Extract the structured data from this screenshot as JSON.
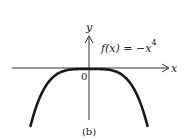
{
  "chart_data": {
    "type": "line",
    "title": "",
    "function_label": "f(x) = −x",
    "function_exponent": "4",
    "xlabel": "x",
    "ylabel": "y",
    "origin_label": "0",
    "caption": "(b)",
    "series": [
      {
        "name": "f(x) = -x^4",
        "x": [
          -1.4,
          -1.2,
          -1.0,
          -0.8,
          -0.6,
          -0.4,
          -0.2,
          0,
          0.2,
          0.4,
          0.6,
          0.8,
          1.0,
          1.2,
          1.4
        ],
        "y": [
          -3.84,
          -2.07,
          -1.0,
          -0.41,
          -0.13,
          -0.03,
          0.0,
          0,
          0.0,
          -0.03,
          -0.13,
          -0.41,
          -1.0,
          -2.07,
          -3.84
        ]
      }
    ],
    "grid": false,
    "legend": "none",
    "colors": {
      "curve": "#1a1a1a",
      "axes": "#333333"
    }
  }
}
